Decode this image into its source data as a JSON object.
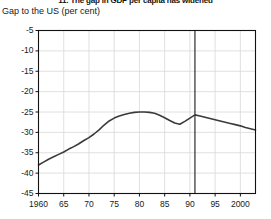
{
  "figure": {
    "title": "11. The gap in GDP per capita has widened",
    "subtitle": "Gap to the US (per cent)"
  },
  "chart_data": {
    "type": "line",
    "title": "11. The gap in GDP per capita has widened",
    "subtitle": "Gap to the US (per cent)",
    "xlabel": "",
    "ylabel": "Gap to the US (per cent)",
    "xlim": [
      1960,
      2003
    ],
    "ylim": [
      -45,
      -5
    ],
    "grid": true,
    "legend": "none",
    "ytick_labels": [
      "-5",
      "-10",
      "-15",
      "-20",
      "-25",
      "-30",
      "-35",
      "-40",
      "-45"
    ],
    "ytick_values": [
      -5,
      -10,
      -15,
      -20,
      -25,
      -30,
      -35,
      -40,
      -45
    ],
    "xtick_labels": [
      "1960",
      "65",
      "70",
      "75",
      "80",
      "85",
      "90",
      "95",
      "2000"
    ],
    "xtick_values": [
      1960,
      1965,
      1970,
      1975,
      1980,
      1985,
      1990,
      1995,
      2000
    ],
    "annotations": [
      {
        "name": "vertical-reference-line",
        "type": "vline",
        "x": 1991
      }
    ],
    "series": [
      {
        "name": "Gap to the US (per cent)",
        "color": "#3a3a3a",
        "x": [
          1960,
          1961,
          1962,
          1963,
          1964,
          1965,
          1966,
          1967,
          1968,
          1969,
          1970,
          1971,
          1972,
          1973,
          1974,
          1975,
          1976,
          1977,
          1978,
          1979,
          1980,
          1981,
          1982,
          1983,
          1984,
          1985,
          1986,
          1987,
          1988,
          1989,
          1990,
          1991,
          1992,
          1993,
          1994,
          1995,
          1996,
          1997,
          1998,
          1999,
          2000,
          2001,
          2002,
          2003
        ],
        "values": [
          -38.0,
          -37.3,
          -36.6,
          -36.0,
          -35.4,
          -34.8,
          -34.1,
          -33.5,
          -32.8,
          -32.0,
          -31.3,
          -30.4,
          -29.4,
          -28.2,
          -27.2,
          -26.5,
          -26.0,
          -25.6,
          -25.3,
          -25.1,
          -25.0,
          -25.0,
          -25.1,
          -25.3,
          -25.8,
          -26.4,
          -27.1,
          -27.7,
          -28.0,
          -27.3,
          -26.5,
          -25.7,
          -26.0,
          -26.3,
          -26.6,
          -26.9,
          -27.2,
          -27.5,
          -27.8,
          -28.1,
          -28.4,
          -28.8,
          -29.1,
          -29.4
        ]
      }
    ]
  }
}
